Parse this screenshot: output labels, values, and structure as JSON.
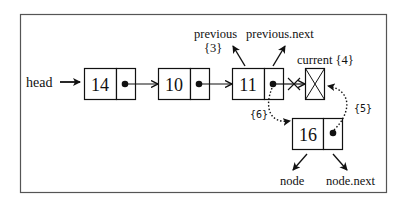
{
  "diagram": {
    "head_label": "head",
    "nodes": [
      {
        "id": "n14",
        "value": "14"
      },
      {
        "id": "n10",
        "value": "10"
      },
      {
        "id": "n11",
        "value": "11"
      },
      {
        "id": "current",
        "value": ""
      },
      {
        "id": "n16",
        "value": "16"
      }
    ],
    "labels": {
      "previous": "previous",
      "previous_step": "{3}",
      "previous_next": "previous.next",
      "current": "current {4}",
      "step5": "{5}",
      "step6": "{6}",
      "node": "node",
      "node_next": "node.next"
    },
    "colors": {
      "stroke": "#111111",
      "frame": "#555555",
      "background": "#ffffff"
    }
  }
}
